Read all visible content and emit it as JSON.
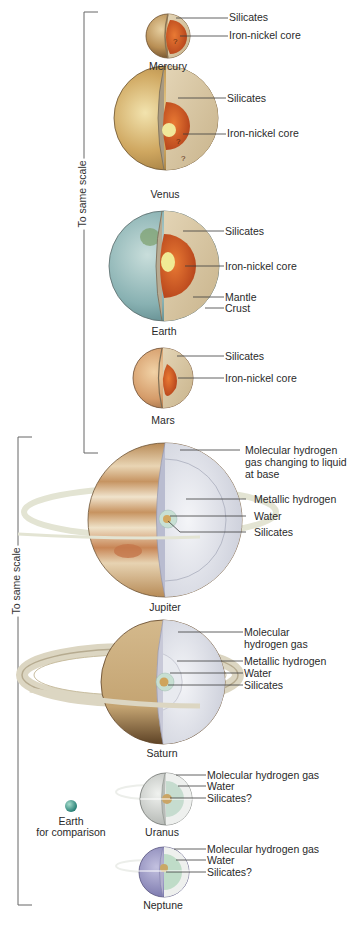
{
  "figure": {
    "terrestrial_group": {
      "scale_label": "To same scale",
      "planets": [
        {
          "name": "Mercury",
          "layers": [
            "Silicates",
            "Iron-nickel core"
          ],
          "markers": [
            "?"
          ]
        },
        {
          "name": "Venus",
          "layers": [
            "Silicates",
            "Iron-nickel core"
          ],
          "markers": [
            "?",
            "?"
          ]
        },
        {
          "name": "Earth",
          "layers": [
            "Silicates",
            "Iron-nickel core",
            "Mantle",
            "Crust"
          ]
        },
        {
          "name": "Mars",
          "layers": [
            "Silicates",
            "Iron-nickel core"
          ]
        }
      ]
    },
    "jovian_group": {
      "scale_label": "To same scale",
      "planets": [
        {
          "name": "Jupiter",
          "layers": [
            "Molecular hydrogen gas changing to liquid at base",
            "Metallic hydrogen",
            "Water",
            "Silicates"
          ]
        },
        {
          "name": "Saturn",
          "layers": [
            "Molecular hydrogen gas",
            "Metallic hydrogen",
            "Water",
            "Silicates"
          ]
        },
        {
          "name": "Uranus",
          "layers": [
            "Molecular hydrogen gas",
            "Water",
            "Silicates?"
          ]
        },
        {
          "name": "Neptune",
          "layers": [
            "Molecular hydrogen gas",
            "Water",
            "Silicates?"
          ]
        }
      ],
      "comparison": {
        "line1": "Earth",
        "line2": "for comparison"
      }
    },
    "colors": {
      "leader_line": "#3a3a3a",
      "bracket": "#555555",
      "silicates": "#d8c6a4",
      "iron_core": "#d9622a",
      "inner_core": "#f2e27a",
      "hydrogen": "#e4e6ee",
      "metallic_hydrogen": "#cfd3de",
      "water": "#b9d8c8",
      "jupiter_surface": "#c9975c",
      "saturn_surface": "#c9ae7e",
      "uranus_surface": "#d9dcd9",
      "neptune_surface": "#8f8cc0",
      "earth_surface": "#8fb7b8"
    }
  }
}
